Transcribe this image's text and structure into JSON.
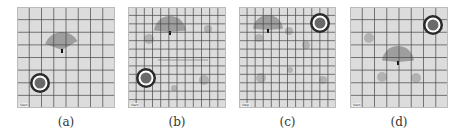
{
  "figure": {
    "panels": [
      {
        "id": "a",
        "caption": "(a)",
        "corner_label": "Start",
        "grid_cols": 8,
        "rect": [
          17,
          7,
          98,
          101
        ],
        "target": {
          "cx": 23,
          "cy": 76,
          "r": 10
        },
        "fan": {
          "cx": 45,
          "cy": 43,
          "r": 18,
          "start": 200,
          "end": 330
        },
        "blobs": [],
        "line": null
      },
      {
        "id": "b",
        "caption": "(b)",
        "corner_label": "Start",
        "grid_cols": 12,
        "rect": [
          128,
          7,
          98,
          101
        ],
        "target": {
          "cx": 18,
          "cy": 71,
          "r": 10
        },
        "fan": {
          "cx": 42,
          "cy": 25,
          "r": 16,
          "start": 185,
          "end": 355
        },
        "blobs": [
          {
            "cx": 21,
            "cy": 32,
            "r": 5
          },
          {
            "cx": 80,
            "cy": 22,
            "r": 4
          },
          {
            "cx": 76,
            "cy": 73,
            "r": 5
          },
          {
            "cx": 46,
            "cy": 81,
            "r": 3
          }
        ],
        "line": {
          "x1": 30,
          "y1": 53,
          "x2": 80,
          "y2": 53
        }
      },
      {
        "id": "c",
        "caption": "(c)",
        "corner_label": "Step",
        "grid_cols": 12,
        "rect": [
          239,
          7,
          97,
          101
        ],
        "target": {
          "cx": 81,
          "cy": 16,
          "r": 10
        },
        "fan": {
          "cx": 29,
          "cy": 23,
          "r": 15,
          "start": 185,
          "end": 355
        },
        "blobs": [
          {
            "cx": 50,
            "cy": 24,
            "r": 4
          },
          {
            "cx": 20,
            "cy": 31,
            "r": 4
          },
          {
            "cx": 67,
            "cy": 38,
            "r": 4
          },
          {
            "cx": 51,
            "cy": 63,
            "r": 3
          },
          {
            "cx": 22,
            "cy": 71,
            "r": 5
          },
          {
            "cx": 84,
            "cy": 73,
            "r": 4
          }
        ],
        "line": null
      },
      {
        "id": "d",
        "caption": "(d)",
        "corner_label": "Start",
        "grid_cols": 8,
        "rect": [
          350,
          7,
          98,
          101
        ],
        "target": {
          "cx": 83,
          "cy": 18,
          "r": 10
        },
        "fan": {
          "cx": 48,
          "cy": 55,
          "r": 16,
          "start": 185,
          "end": 355
        },
        "blobs": [
          {
            "cx": 19,
            "cy": 31,
            "r": 5
          },
          {
            "cx": 32,
            "cy": 70,
            "r": 5
          },
          {
            "cx": 66,
            "cy": 71,
            "r": 5
          }
        ],
        "line": null
      }
    ],
    "colors": {
      "background": "#dcdcdc",
      "grid": "#4a4a4a",
      "fan": "#8a8a8a",
      "blob": "#a8a8a8",
      "target_ring": "#2a2a2a",
      "target_inner": "#ffffff",
      "target_core": "#6a6a6a"
    }
  }
}
